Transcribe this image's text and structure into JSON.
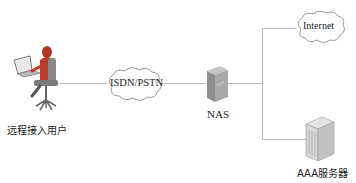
{
  "diagram": {
    "nodes": {
      "remote_user": {
        "label": "远程接入用户",
        "icon": "user-at-computer-icon"
      },
      "pstn_cloud": {
        "label": "ISDN/PSTN",
        "icon": "cloud-icon"
      },
      "nas": {
        "label": "NAS",
        "icon": "nas-device-icon",
        "device_text": "NAS"
      },
      "internet_cloud": {
        "label": "Internet",
        "icon": "cloud-icon"
      },
      "aaa_server": {
        "label": "AAA服务器",
        "icon": "server-tower-icon"
      }
    },
    "edges": [
      {
        "from": "remote_user",
        "to": "pstn_cloud"
      },
      {
        "from": "pstn_cloud",
        "to": "nas"
      },
      {
        "from": "nas",
        "to": "internet_cloud"
      },
      {
        "from": "nas",
        "to": "aaa_server"
      }
    ],
    "colors": {
      "line": "#b8b8b8",
      "cloud_stroke": "#9a9a9a",
      "device_gray": "#9c9c9c",
      "user_red": "#c0392b"
    }
  }
}
